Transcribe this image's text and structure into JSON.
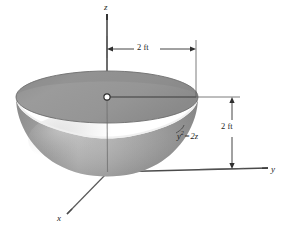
{
  "figure": {
    "axes": {
      "z": "z",
      "y": "y",
      "x": "x"
    },
    "dimensions": {
      "radius": "2 ft",
      "depth": "2 ft"
    },
    "equation": {
      "variable": "y",
      "exponent": "2",
      "operator": "=",
      "expression": "2z",
      "full": "y2 = 2z"
    },
    "colors": {
      "surface_top": "#969696",
      "surface_outer": "#a8a8a8",
      "surface_shadow": "#7e7e7e",
      "rim_highlight": "#f2f2f2",
      "line": "#3a3a3a",
      "text": "#1c1c1c",
      "background": "#ffffff"
    },
    "geometry": {
      "origin_x": 107,
      "origin_y": 97,
      "rim_semi_major": 91,
      "rim_semi_minor": 26,
      "bowl_bottom_y": 172
    }
  }
}
